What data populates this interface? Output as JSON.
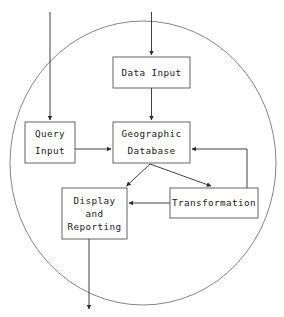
{
  "figure": {
    "type": "flow-diagram",
    "title_partial": "",
    "boundary": {
      "shape": "circle",
      "label": "",
      "cx": 143,
      "cy": 163,
      "rx": 133,
      "ry": 142,
      "color": "#777777"
    },
    "colors": {
      "box_stroke": "#555555",
      "box_fill": "#ffffff",
      "arrow": "#2b2b2b",
      "boundary": "#777777",
      "background": "#ffffff",
      "text": "#1a1a1a"
    }
  },
  "nodes": [
    {
      "id": "data-input",
      "lines": [
        "Data Input"
      ],
      "x": 113,
      "y": 57,
      "w": 77,
      "h": 31
    },
    {
      "id": "query-input",
      "lines": [
        "Query",
        "Input"
      ],
      "x": 25,
      "y": 122,
      "w": 50,
      "h": 41
    },
    {
      "id": "geographic-database",
      "lines": [
        "Geographic",
        "Database"
      ],
      "x": 113,
      "y": 122,
      "w": 77,
      "h": 41
    },
    {
      "id": "display-and-reporting",
      "lines": [
        "Display",
        "and",
        "Reporting"
      ],
      "x": 62,
      "y": 188,
      "w": 65,
      "h": 51
    },
    {
      "id": "transformation",
      "lines": [
        "Transformation"
      ],
      "x": 170,
      "y": 188,
      "w": 88,
      "h": 30
    }
  ],
  "edges": [
    {
      "id": "external-to-data-input",
      "from": "external-top",
      "to": "data-input",
      "arrow": true
    },
    {
      "id": "external-to-query-input",
      "from": "external-top",
      "to": "query-input",
      "arrow": true
    },
    {
      "id": "data-input-to-database",
      "from": "data-input",
      "to": "geographic-database",
      "arrow": true
    },
    {
      "id": "query-input-to-database",
      "from": "query-input",
      "to": "geographic-database",
      "arrow": true
    },
    {
      "id": "database-to-display",
      "from": "geographic-database",
      "to": "display-and-reporting",
      "arrow": true
    },
    {
      "id": "database-to-transformation",
      "from": "geographic-database",
      "to": "transformation",
      "arrow": true
    },
    {
      "id": "transformation-to-display",
      "from": "transformation",
      "to": "display-and-reporting",
      "arrow": true
    },
    {
      "id": "transformation-to-database",
      "from": "transformation",
      "to": "geographic-database",
      "arrow": true
    },
    {
      "id": "display-to-external",
      "from": "display-and-reporting",
      "to": "external-bottom",
      "arrow": true
    }
  ]
}
